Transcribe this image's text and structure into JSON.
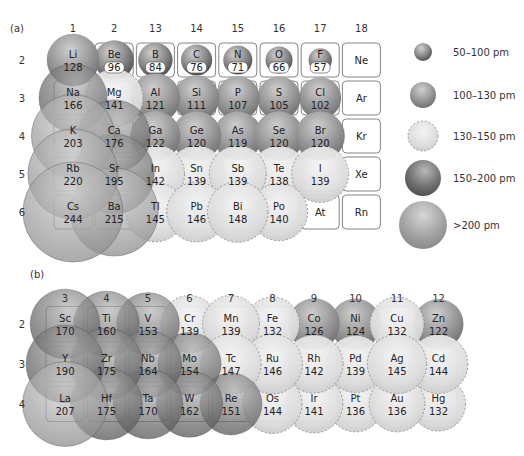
{
  "panel_a": {
    "label": "(a)",
    "groups": [
      "1",
      "2",
      "13",
      "14",
      "15",
      "16",
      "17",
      "18"
    ],
    "periods": [
      "2",
      "3",
      "4",
      "5",
      "6"
    ],
    "elements": [
      {
        "sym": "Li",
        "r": 128,
        "g": 0,
        "p": 0
      },
      {
        "sym": "Be",
        "r": 96,
        "g": 1,
        "p": 0
      },
      {
        "sym": "B",
        "r": 84,
        "g": 2,
        "p": 0
      },
      {
        "sym": "C",
        "r": 76,
        "g": 3,
        "p": 0
      },
      {
        "sym": "N",
        "r": 71,
        "g": 4,
        "p": 0
      },
      {
        "sym": "O",
        "r": 66,
        "g": 5,
        "p": 0
      },
      {
        "sym": "F",
        "r": 57,
        "g": 6,
        "p": 0
      },
      {
        "sym": "Ne",
        "r": null,
        "g": 7,
        "p": 0
      },
      {
        "sym": "Na",
        "r": 166,
        "g": 0,
        "p": 1
      },
      {
        "sym": "Mg",
        "r": 141,
        "g": 1,
        "p": 1
      },
      {
        "sym": "Al",
        "r": 121,
        "g": 2,
        "p": 1
      },
      {
        "sym": "Si",
        "r": 111,
        "g": 3,
        "p": 1
      },
      {
        "sym": "P",
        "r": 107,
        "g": 4,
        "p": 1
      },
      {
        "sym": "S",
        "r": 105,
        "g": 5,
        "p": 1
      },
      {
        "sym": "Cl",
        "r": 102,
        "g": 6,
        "p": 1
      },
      {
        "sym": "Ar",
        "r": null,
        "g": 7,
        "p": 1
      },
      {
        "sym": "K",
        "r": 203,
        "g": 0,
        "p": 2
      },
      {
        "sym": "Ca",
        "r": 176,
        "g": 1,
        "p": 2
      },
      {
        "sym": "Ga",
        "r": 122,
        "g": 2,
        "p": 2
      },
      {
        "sym": "Ge",
        "r": 120,
        "g": 3,
        "p": 2
      },
      {
        "sym": "As",
        "r": 119,
        "g": 4,
        "p": 2
      },
      {
        "sym": "Se",
        "r": 120,
        "g": 5,
        "p": 2
      },
      {
        "sym": "Br",
        "r": 120,
        "g": 6,
        "p": 2
      },
      {
        "sym": "Kr",
        "r": null,
        "g": 7,
        "p": 2
      },
      {
        "sym": "Rb",
        "r": 220,
        "g": 0,
        "p": 3
      },
      {
        "sym": "Sr",
        "r": 195,
        "g": 1,
        "p": 3
      },
      {
        "sym": "In",
        "r": 142,
        "g": 2,
        "p": 3
      },
      {
        "sym": "Sn",
        "r": 139,
        "g": 3,
        "p": 3
      },
      {
        "sym": "Sb",
        "r": 139,
        "g": 4,
        "p": 3
      },
      {
        "sym": "Te",
        "r": 138,
        "g": 5,
        "p": 3
      },
      {
        "sym": "I",
        "r": 139,
        "g": 6,
        "p": 3
      },
      {
        "sym": "Xe",
        "r": null,
        "g": 7,
        "p": 3
      },
      {
        "sym": "Cs",
        "r": 244,
        "g": 0,
        "p": 4
      },
      {
        "sym": "Ba",
        "r": 215,
        "g": 1,
        "p": 4
      },
      {
        "sym": "Tl",
        "r": 145,
        "g": 2,
        "p": 4
      },
      {
        "sym": "Pb",
        "r": 146,
        "g": 3,
        "p": 4
      },
      {
        "sym": "Bi",
        "r": 148,
        "g": 4,
        "p": 4
      },
      {
        "sym": "Po",
        "r": 140,
        "g": 5,
        "p": 4
      },
      {
        "sym": "At",
        "r": null,
        "g": 6,
        "p": 4
      },
      {
        "sym": "Rn",
        "r": null,
        "g": 7,
        "p": 4
      }
    ]
  },
  "panel_b": {
    "label": "(b)",
    "groups": [
      "3",
      "4",
      "5",
      "6",
      "7",
      "8",
      "9",
      "10",
      "11",
      "12"
    ],
    "periods": [
      "2",
      "3",
      "4"
    ],
    "elements": [
      {
        "sym": "Sc",
        "r": 170,
        "g": 0,
        "p": 0
      },
      {
        "sym": "Ti",
        "r": 160,
        "g": 1,
        "p": 0
      },
      {
        "sym": "V",
        "r": 153,
        "g": 2,
        "p": 0
      },
      {
        "sym": "Cr",
        "r": 139,
        "g": 3,
        "p": 0
      },
      {
        "sym": "Mn",
        "r": 139,
        "g": 4,
        "p": 0
      },
      {
        "sym": "Fe",
        "r": 132,
        "g": 5,
        "p": 0
      },
      {
        "sym": "Co",
        "r": 126,
        "g": 6,
        "p": 0
      },
      {
        "sym": "Ni",
        "r": 124,
        "g": 7,
        "p": 0
      },
      {
        "sym": "Cu",
        "r": 132,
        "g": 8,
        "p": 0
      },
      {
        "sym": "Zn",
        "r": 122,
        "g": 9,
        "p": 0
      },
      {
        "sym": "Y",
        "r": 190,
        "g": 0,
        "p": 1
      },
      {
        "sym": "Zr",
        "r": 175,
        "g": 1,
        "p": 1
      },
      {
        "sym": "Nb",
        "r": 164,
        "g": 2,
        "p": 1
      },
      {
        "sym": "Mo",
        "r": 154,
        "g": 3,
        "p": 1
      },
      {
        "sym": "Tc",
        "r": 147,
        "g": 4,
        "p": 1
      },
      {
        "sym": "Ru",
        "r": 146,
        "g": 5,
        "p": 1
      },
      {
        "sym": "Rh",
        "r": 142,
        "g": 6,
        "p": 1
      },
      {
        "sym": "Pd",
        "r": 139,
        "g": 7,
        "p": 1
      },
      {
        "sym": "Ag",
        "r": 145,
        "g": 8,
        "p": 1
      },
      {
        "sym": "Cd",
        "r": 144,
        "g": 9,
        "p": 1
      },
      {
        "sym": "La",
        "r": 207,
        "g": 0,
        "p": 2
      },
      {
        "sym": "Hf",
        "r": 175,
        "g": 1,
        "p": 2
      },
      {
        "sym": "Ta",
        "r": 170,
        "g": 2,
        "p": 2
      },
      {
        "sym": "W",
        "r": 162,
        "g": 3,
        "p": 2
      },
      {
        "sym": "Re",
        "r": 151,
        "g": 4,
        "p": 2
      },
      {
        "sym": "Os",
        "r": 144,
        "g": 5,
        "p": 2
      },
      {
        "sym": "Ir",
        "r": 141,
        "g": 6,
        "p": 2
      },
      {
        "sym": "Pt",
        "r": 136,
        "g": 7,
        "p": 2
      },
      {
        "sym": "Au",
        "r": 136,
        "g": 8,
        "p": 2
      },
      {
        "sym": "Hg",
        "r": 132,
        "g": 9,
        "p": 2
      }
    ]
  },
  "legend": [
    {
      "label": "50–100 pm",
      "class": "c1"
    },
    {
      "label": "100–130 pm",
      "class": "c2"
    },
    {
      "label": "130–150 pm",
      "class": "c3"
    },
    {
      "label": "150–200 pm",
      "class": "c4"
    },
    {
      "label": ">200 pm",
      "class": "c5"
    }
  ],
  "unit": "pm",
  "colors": {
    "c1": "#8a8a8a",
    "c2": "#909090",
    "c3": "#d8d8d8",
    "c4": "#6e6e6e",
    "c5": "#9a9a9a",
    "box_stroke": "#666666"
  }
}
